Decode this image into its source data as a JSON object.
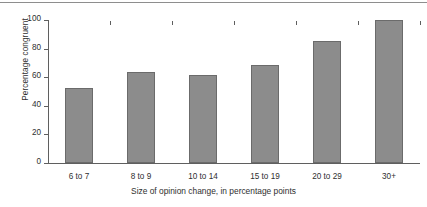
{
  "chart_data": {
    "type": "bar",
    "title": "",
    "categories": [
      "6 to 7",
      "8 to 9",
      "10 to 14",
      "15 to 19",
      "20 to 29",
      "30+"
    ],
    "values": [
      52.5,
      63.5,
      61.5,
      68.5,
      85.5,
      100
    ],
    "xlabel": "Size of opinion change, in percentage points",
    "ylabel": "Percentage congruent",
    "ylim": [
      0,
      100
    ],
    "yticks": [
      0,
      20,
      40,
      60,
      80,
      100
    ],
    "ytick_labels": [
      "0",
      "20",
      "40",
      "60",
      "80",
      "100"
    ],
    "grid": false,
    "legend": "none",
    "bar_color": "#8c8c8c",
    "bar_edge_color": "#6b6b6b",
    "axis_color": "#5f5f5f",
    "background_color": "#ffffff"
  }
}
